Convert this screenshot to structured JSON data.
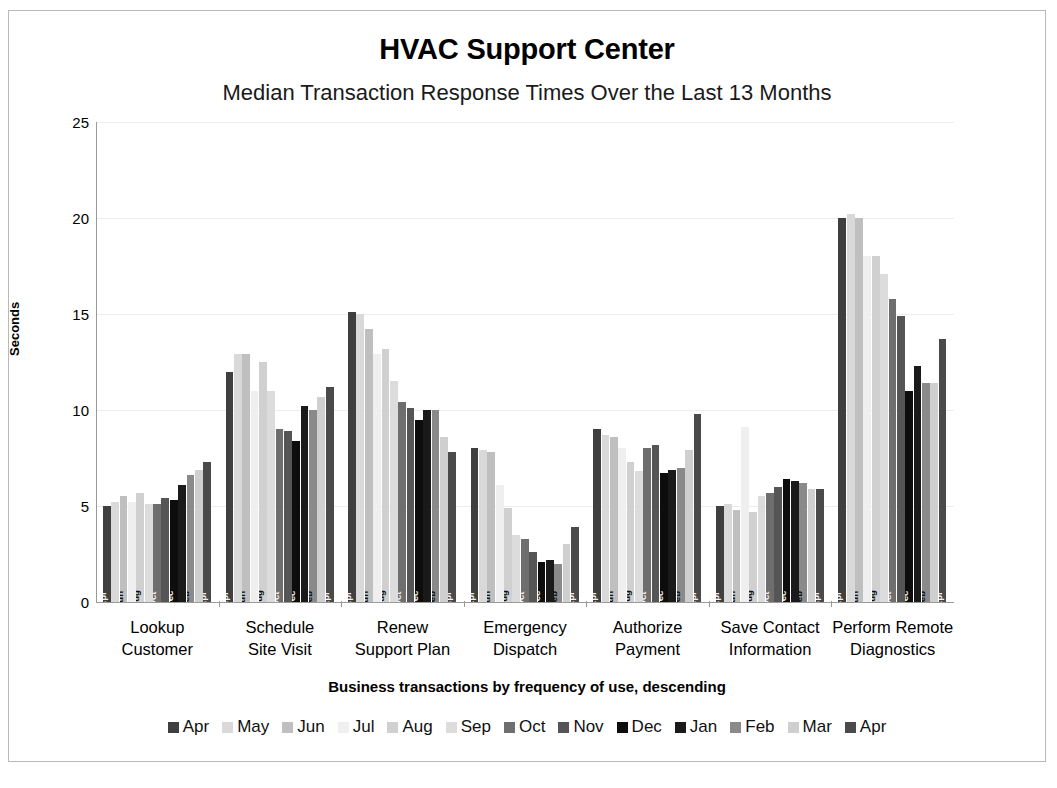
{
  "chart_data": {
    "type": "bar",
    "title": "HVAC Support Center",
    "subtitle": "Median Transaction Response Times Over the Last 13 Months",
    "xlabel": "Business transactions by frequency of use, descending",
    "ylabel": "Seconds",
    "ylim": [
      0,
      25
    ],
    "yticks": [
      0,
      5,
      10,
      15,
      20,
      25
    ],
    "ytick_labels": [
      "0",
      "5",
      "10",
      "15",
      "20",
      "25"
    ],
    "grid": true,
    "legend_position": "bottom",
    "categories": [
      "Lookup Customer",
      "Schedule Site Visit",
      "Renew Support Plan",
      "Emergency Dispatch",
      "Authorize Payment",
      "Save Contact Information",
      "Perform Remote Diagnostics"
    ],
    "category_lines": [
      [
        "Lookup",
        "Customer"
      ],
      [
        "Schedule",
        "Site Visit"
      ],
      [
        "Renew",
        "Support Plan"
      ],
      [
        "Emergency",
        "Dispatch"
      ],
      [
        "Authorize",
        "Payment"
      ],
      [
        "Save Contact",
        "Information"
      ],
      [
        "Perform Remote",
        "Diagnostics"
      ]
    ],
    "series": [
      {
        "name": "Apr",
        "color": "#3f3f3f",
        "values": [
          5.0,
          12.0,
          15.1,
          8.0,
          9.0,
          5.0,
          20.0
        ]
      },
      {
        "name": "May",
        "color": "#d9d9d9",
        "values": [
          5.2,
          12.9,
          15.0,
          7.9,
          8.7,
          5.1,
          20.2
        ]
      },
      {
        "name": "Jun",
        "color": "#bfbfbf",
        "values": [
          5.5,
          12.9,
          14.2,
          7.8,
          8.6,
          4.8,
          20.0
        ]
      },
      {
        "name": "Jul",
        "color": "#efefef",
        "values": [
          5.2,
          11.0,
          12.9,
          6.1,
          8.0,
          9.1,
          18.0
        ]
      },
      {
        "name": "Aug",
        "color": "#d0d0d0",
        "values": [
          5.7,
          12.5,
          13.2,
          4.9,
          7.3,
          4.7,
          18.0
        ]
      },
      {
        "name": "Sep",
        "color": "#dcdcdc",
        "values": [
          5.1,
          11.0,
          11.5,
          3.5,
          6.8,
          5.5,
          17.1
        ]
      },
      {
        "name": "Oct",
        "color": "#6e6e6e",
        "values": [
          5.1,
          9.0,
          10.4,
          3.3,
          8.0,
          5.7,
          15.8
        ]
      },
      {
        "name": "Nov",
        "color": "#555555",
        "values": [
          5.4,
          8.9,
          10.1,
          2.6,
          8.2,
          6.0,
          14.9
        ]
      },
      {
        "name": "Dec",
        "color": "#0d0d0d",
        "values": [
          5.3,
          8.4,
          9.5,
          2.1,
          6.7,
          6.4,
          11.0
        ]
      },
      {
        "name": "Jan",
        "color": "#1a1a1a",
        "values": [
          6.1,
          10.2,
          10.0,
          2.2,
          6.9,
          6.3,
          12.3
        ]
      },
      {
        "name": "Feb",
        "color": "#8a8a8a",
        "values": [
          6.6,
          10.0,
          10.0,
          2.0,
          7.0,
          6.2,
          11.4
        ]
      },
      {
        "name": "Mar",
        "color": "#cfcfcf",
        "values": [
          6.9,
          10.7,
          8.6,
          3.0,
          7.9,
          5.9,
          11.4
        ]
      },
      {
        "name": "Apr",
        "color": "#4a4a4a",
        "values": [
          7.3,
          11.2,
          7.8,
          3.9,
          9.8,
          5.9,
          13.7
        ]
      }
    ]
  },
  "legend": {
    "items": [
      {
        "label": "Apr",
        "color": "#3f3f3f"
      },
      {
        "label": "May",
        "color": "#d9d9d9"
      },
      {
        "label": "Jun",
        "color": "#bfbfbf"
      },
      {
        "label": "Jul",
        "color": "#efefef"
      },
      {
        "label": "Aug",
        "color": "#d0d0d0"
      },
      {
        "label": "Sep",
        "color": "#dcdcdc"
      },
      {
        "label": "Oct",
        "color": "#6e6e6e"
      },
      {
        "label": "Nov",
        "color": "#555555"
      },
      {
        "label": "Dec",
        "color": "#0d0d0d"
      },
      {
        "label": "Jan",
        "color": "#1a1a1a"
      },
      {
        "label": "Feb",
        "color": "#8a8a8a"
      },
      {
        "label": "Mar",
        "color": "#cfcfcf"
      },
      {
        "label": "Apr",
        "color": "#4a4a4a"
      }
    ]
  },
  "style": {
    "gridline_color": "#ededed",
    "axis_color": "#9a9a9a",
    "frame_color": "#b8b8b8",
    "background": "#ffffff",
    "text_color": "#000000"
  }
}
